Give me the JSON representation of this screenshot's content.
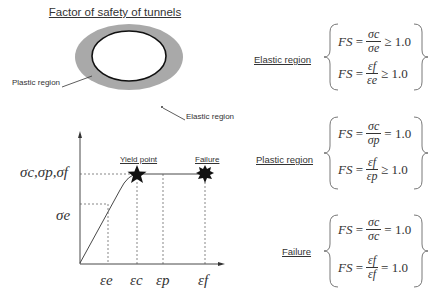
{
  "title": "Factor of safety of tunnels",
  "tunnel_diagram": {
    "plastic_label": "Plastic region",
    "elastic_label": "Elastic region"
  },
  "graph": {
    "yield_label": "Yield point",
    "failure_label": "Failure",
    "y_ticks": [
      "σc,σp,σf",
      "σe"
    ],
    "x_ticks": [
      "εe",
      "εc",
      "εp",
      "εf"
    ]
  },
  "conditions": [
    {
      "label": "Elastic region",
      "eq1": {
        "lhs": "FS",
        "num": "σc",
        "den": "σe",
        "rel": "≥ 1.0"
      },
      "eq2": {
        "lhs": "FS",
        "num": "εf",
        "den": "εe",
        "rel": "≥ 1.0"
      }
    },
    {
      "label": "Plastic region",
      "eq1": {
        "lhs": "FS",
        "num": "σc",
        "den": "σp",
        "rel": "= 1.0"
      },
      "eq2": {
        "lhs": "FS",
        "num": "εf",
        "den": "εp",
        "rel": "≥ 1.0"
      }
    },
    {
      "label": "Failure",
      "eq1": {
        "lhs": "FS",
        "num": "σc",
        "den": "σc",
        "rel": "= 1.0"
      },
      "eq2": {
        "lhs": "FS",
        "num": "εf",
        "den": "εf",
        "rel": "= 1.0"
      }
    }
  ]
}
